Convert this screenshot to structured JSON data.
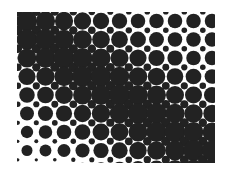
{
  "image": {
    "description": "Halftone dot pattern with a dark diagonal band running from top-left to bottom-right",
    "width": 230,
    "height": 170,
    "background": "#ffffff",
    "ink": "#222222"
  },
  "halftone": {
    "bounds": {
      "x0": 17,
      "y0": 12,
      "x1": 215,
      "y1": 163
    },
    "pitch": 18.5,
    "origin": {
      "x": 27,
      "y": 21
    },
    "large_dot_radius_min": 5.5,
    "large_dot_radius_max": 10.5,
    "small_dot_radius_min": 1.6,
    "small_dot_radius_max": 5.0,
    "band": {
      "description": "dark diagonal band",
      "direction": "top-left to bottom-right",
      "width_px": 70
    }
  }
}
